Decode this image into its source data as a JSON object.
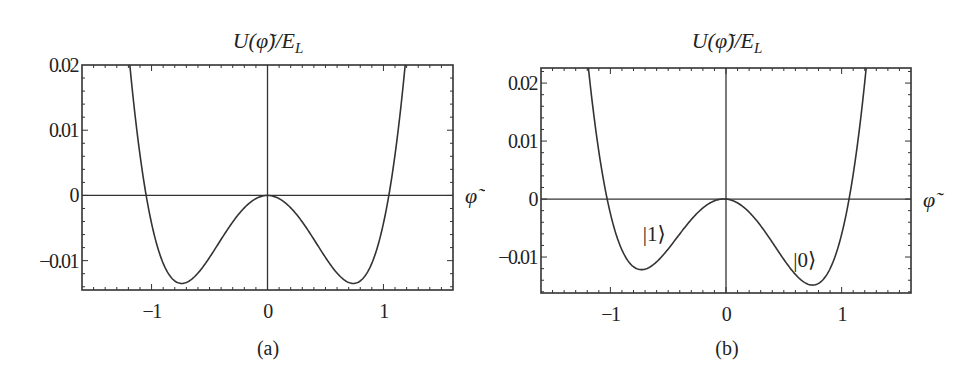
{
  "chart_data": [
    {
      "type": "line",
      "panel": "(a)",
      "title": "U(φ̃)/E_L",
      "xlabel": "φ̃",
      "ylabel": "",
      "xlim": [
        -1.6,
        1.6
      ],
      "ylim": [
        -0.0145,
        0.02
      ],
      "xticks": [
        -1,
        0,
        1
      ],
      "yticks": [
        -0.01,
        0,
        0.01,
        0.02
      ],
      "xtick_labels": [
        "−1",
        "0",
        "1"
      ],
      "ytick_labels": [
        "−0.01",
        "0",
        "0.01",
        "0.02"
      ],
      "grid": false,
      "axes_lines_at_zero": true,
      "series": [
        {
          "name": "symmetric double-well potential",
          "model": {
            "k": 0.045,
            "m": 0.74,
            "tilt": 0.0
          },
          "x": [
            -1.2,
            -1.05,
            -0.9,
            -0.74,
            -0.5,
            -0.25,
            0,
            0.25,
            0.5,
            0.74,
            0.9,
            1.05,
            1.2
          ],
          "y": [
            0.0223,
            0.0,
            -0.0098,
            -0.0135,
            -0.0095,
            -0.0031,
            0.0,
            -0.0031,
            -0.0095,
            -0.0135,
            -0.0098,
            0.0,
            0.0223
          ]
        }
      ],
      "annotations": []
    },
    {
      "type": "line",
      "panel": "(b)",
      "title": "U(φ̃)/E_L",
      "xlabel": "φ̃",
      "ylabel": "",
      "xlim": [
        -1.6,
        1.6
      ],
      "ylim": [
        -0.0162,
        0.0226
      ],
      "xticks": [
        -1,
        0,
        1
      ],
      "yticks": [
        -0.01,
        0,
        0.01,
        0.02
      ],
      "xtick_labels": [
        "−1",
        "0",
        "1"
      ],
      "ytick_labels": [
        "−0.01",
        "0",
        "0.01",
        "0.02"
      ],
      "grid": false,
      "axes_lines_at_zero": true,
      "series": [
        {
          "name": "tilted double-well potential",
          "model": {
            "k": 0.045,
            "m": 0.74,
            "tilt": 0.0018
          },
          "x": [
            -1.2,
            -1.0,
            -0.74,
            -0.5,
            -0.25,
            0,
            0.25,
            0.5,
            0.74,
            1.0,
            1.1,
            1.2
          ],
          "y": [
            0.0245,
            0.0014,
            -0.0122,
            -0.0086,
            -0.0026,
            0.0,
            -0.0035,
            -0.0104,
            -0.0148,
            -0.0018,
            0.0063,
            0.0202
          ]
        }
      ],
      "annotations": [
        {
          "text": "|1⟩",
          "x": -0.62,
          "y": -0.0073
        },
        {
          "text": "|0⟩",
          "x": 0.68,
          "y": -0.0118
        }
      ]
    }
  ],
  "panels": [
    {
      "title": "U(φ̃)/E_L",
      "xlabel": "φ̃",
      "caption": "(a)"
    },
    {
      "title": "U(φ̃)/E_L",
      "xlabel": "φ̃",
      "caption": "(b)"
    }
  ]
}
